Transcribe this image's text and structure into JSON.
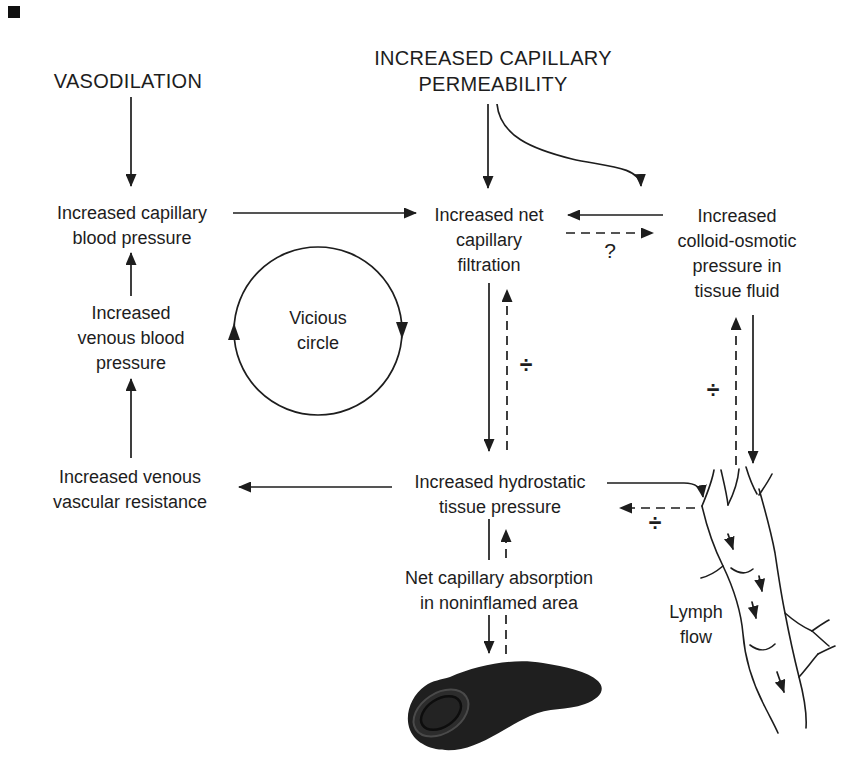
{
  "colors": {
    "ink": "#1d1d1d",
    "background": "#ffffff",
    "edema_fill": "#1f1f1f"
  },
  "nodes": {
    "vasodilation": "VASODILATION",
    "permeability": [
      "INCREASED CAPILLARY",
      "PERMEABILITY"
    ],
    "capillary_bp": [
      "Increased capillary",
      "blood pressure"
    ],
    "venous_bp": [
      "Increased",
      "venous blood",
      "pressure"
    ],
    "venous_resistance": [
      "Increased venous",
      "vascular resistance"
    ],
    "vicious_circle": [
      "Vicious",
      "circle"
    ],
    "net_filtration": [
      "Increased net",
      "capillary",
      "filtration"
    ],
    "colloid_osmotic": [
      "Increased",
      "colloid-osmotic",
      "pressure in",
      "tissue fluid"
    ],
    "hydrostatic": [
      "Increased hydrostatic",
      "tissue pressure"
    ],
    "net_absorption": [
      "Net capillary absorption",
      "in noninflamed area"
    ],
    "lymph_flow": [
      "Lymph",
      "flow"
    ]
  },
  "symbols": {
    "question_mark": "?",
    "divide_center": "÷",
    "divide_right": "÷",
    "divide_lymph": "÷"
  }
}
